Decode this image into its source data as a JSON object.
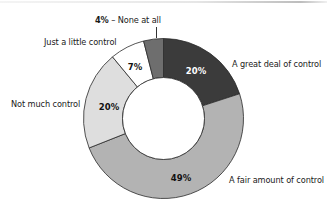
{
  "chart_data": {
    "type": "pie",
    "variant": "donut",
    "title": "",
    "start_angle_deg": 0,
    "direction": "clockwise",
    "slices": [
      {
        "label": "A great deal of control",
        "value": 20,
        "display": "20%",
        "color": "#3b3b3b",
        "text_color": "#ffffff"
      },
      {
        "label": "A fair amount of control",
        "value": 49,
        "display": "49%",
        "color": "#b3b3b3",
        "text_color": "#111111"
      },
      {
        "label": "Not much control",
        "value": 20,
        "display": "20%",
        "color": "#dedede",
        "text_color": "#111111"
      },
      {
        "label": "Just a little control",
        "value": 7,
        "display": "7%",
        "color": "#ffffff",
        "text_color": "#111111"
      },
      {
        "label": "None at all",
        "value": 4,
        "display": "4%",
        "color": "#6e6e6e",
        "text_color": "#111111"
      }
    ],
    "outside_label_for_small_slice": {
      "pct": "4%",
      "sep": " – ",
      "text": "None at all"
    },
    "legend": "none (direct labels)"
  }
}
